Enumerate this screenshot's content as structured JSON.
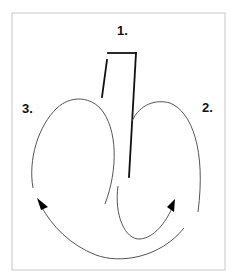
{
  "diagram": {
    "labels": {
      "step1": "1.",
      "step2": "2.",
      "step3": "3."
    },
    "colors": {
      "border": "#c8c8c8",
      "thin_line": "#555555",
      "thick_line": "#111111",
      "arrowhead": "#000000",
      "background": "#ffffff"
    }
  }
}
